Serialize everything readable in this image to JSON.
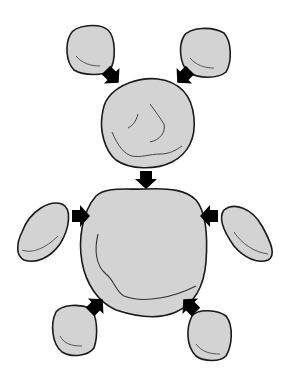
{
  "figure": {
    "colors": {
      "fill": "#d3d3d3",
      "stroke": "#1a1a1a",
      "arrow": "#000000",
      "background": "#ffffff"
    },
    "parts": [
      {
        "name": "left-ear"
      },
      {
        "name": "right-ear"
      },
      {
        "name": "head"
      },
      {
        "name": "body"
      },
      {
        "name": "left-arm"
      },
      {
        "name": "right-arm"
      },
      {
        "name": "left-leg"
      },
      {
        "name": "right-leg"
      }
    ],
    "arrows": [
      {
        "name": "arrow-left-ear-to-head",
        "direction": "down-right"
      },
      {
        "name": "arrow-right-ear-to-head",
        "direction": "down-left"
      },
      {
        "name": "arrow-head-to-body",
        "direction": "down"
      },
      {
        "name": "arrow-left-arm-to-body",
        "direction": "right"
      },
      {
        "name": "arrow-right-arm-to-body",
        "direction": "left"
      },
      {
        "name": "arrow-left-leg-to-body",
        "direction": "up-right"
      },
      {
        "name": "arrow-right-leg-to-body",
        "direction": "up-left"
      }
    ]
  }
}
